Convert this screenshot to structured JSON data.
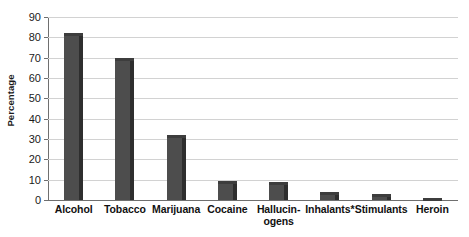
{
  "chart_data": {
    "type": "bar",
    "title": "",
    "xlabel": "",
    "ylabel": "Percentage",
    "ylim": [
      0,
      90
    ],
    "ytick_step": 10,
    "grid": true,
    "legend": "none",
    "bar_color": "#4d4d4d",
    "bar_side_color": "#2e2e2e",
    "gridline_color": "#d2d2d2",
    "axis_color": "#6f6f6f",
    "background": "#ffffff",
    "categories": [
      "Alcohol",
      "Tobacco",
      "Marijuana",
      "Cocaine",
      "Hallucinogens",
      "Inhalants*",
      "Stimulants",
      "Heroin"
    ],
    "category_labels": [
      {
        "line1": "Alcohol",
        "line2": ""
      },
      {
        "line1": "Tobacco",
        "line2": ""
      },
      {
        "line1": "Marijuana",
        "line2": ""
      },
      {
        "line1": "Cocaine",
        "line2": ""
      },
      {
        "line1": "Hallucin-",
        "line2": "ogens"
      },
      {
        "line1": "Inhalants*",
        "line2": ""
      },
      {
        "line1": "Stimulants",
        "line2": ""
      },
      {
        "line1": "Heroin",
        "line2": ""
      }
    ],
    "values": [
      82,
      70,
      32,
      9.5,
      9,
      4,
      3,
      1
    ],
    "ytick_labels": [
      "90",
      "80",
      "70",
      "60",
      "50",
      "40",
      "30",
      "20",
      "10",
      "0"
    ],
    "ytick_values": [
      90,
      80,
      70,
      60,
      50,
      40,
      30,
      20,
      10,
      0
    ]
  }
}
